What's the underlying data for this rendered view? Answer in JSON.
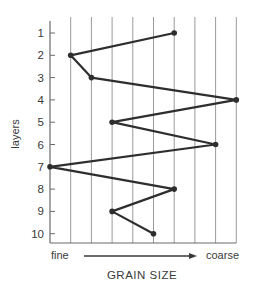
{
  "chart_data": {
    "type": "line",
    "title": "",
    "xlabel": "GRAIN SIZE",
    "ylabel": "layers",
    "x_scale_labels": {
      "left": "fine",
      "right": "coarse"
    },
    "x_arrow": "fine → coarse",
    "xlim": [
      0,
      9
    ],
    "ylim": [
      1,
      10
    ],
    "y_inverted": true,
    "grid": {
      "vertical": true,
      "horizontal": false,
      "vertical_lines": 9
    },
    "layers": [
      1,
      2,
      3,
      4,
      5,
      6,
      7,
      8,
      9,
      10
    ],
    "grain_size": [
      6,
      1,
      2,
      9,
      3,
      8,
      0,
      6,
      3,
      5
    ],
    "yticks": [
      "1",
      "2",
      "3",
      "4",
      "5",
      "6",
      "7",
      "8",
      "9",
      "10"
    ],
    "legend": null
  },
  "labels": {
    "ylabel": "layers",
    "xlabel": "GRAIN SIZE",
    "fine": "fine",
    "coarse": "coarse"
  },
  "colors": {
    "line": "#2e2e2e",
    "grid": "#9a9a9a",
    "axis": "#6a6a6a",
    "text": "#3a3a3a"
  }
}
